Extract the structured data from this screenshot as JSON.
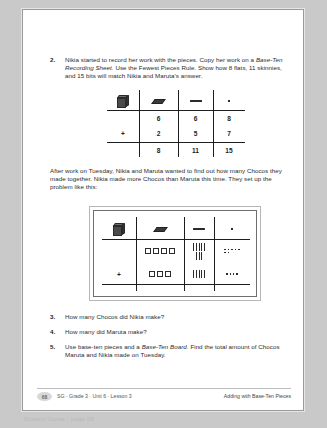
{
  "page": {
    "problem2": {
      "number": "2.",
      "text_part1": "Nikia started to record her work with the pieces. Copy her work on a ",
      "text_italic1": "Base-Ten Recording Sheet.",
      "text_part2": " Use the Fewest Pieces Rule. Show how 8 flats, 11 skinnies, and 15 bits will match Nikia and Maruta's answer."
    },
    "recording_table": {
      "headers": [
        "pack-icon",
        "flat-icon",
        "skinny-icon",
        "bit-icon"
      ],
      "rows": [
        {
          "op": "",
          "flats": "6",
          "skinnies": "6",
          "bits": "8"
        },
        {
          "op": "+",
          "flats": "2",
          "skinnies": "5",
          "bits": "7"
        },
        {
          "op": "",
          "flats": "8",
          "skinnies": "11",
          "bits": "15"
        }
      ]
    },
    "middle_paragraph": "After work on Tuesday, Nikia and Maruta wanted to find out how many Chocos they made together. Nikia made more Chocos than Maruta this time. They set up the problem like this:",
    "pieces_table": {
      "headers": [
        "pack-icon",
        "flat-icon",
        "skinny-icon",
        "bit-icon"
      ],
      "rows": [
        {
          "op": "",
          "flats": 4,
          "skinny_groups": [
            5,
            3
          ],
          "bit_rows": [
            5,
            2
          ]
        },
        {
          "op": "+",
          "flats": 3,
          "skinny_groups": [
            5
          ],
          "bit_rows": [
            4
          ]
        }
      ]
    },
    "questions": [
      {
        "number": "3.",
        "text": "How many Chocos did Nikia make?"
      },
      {
        "number": "4.",
        "text": "How many did Maruta make?"
      },
      {
        "number": "5.",
        "text_part1": "Use base-ten pieces and a ",
        "text_italic1": "Base-Ten Board.",
        "text_part2": " Find the total amount of Chocos Maruta and Nikia made on Tuesday."
      }
    ],
    "footer": {
      "page_number": "68",
      "left": "SG · Grade 3 · Unit 6 · Lesson 3",
      "right": "Adding with Base-Ten Pieces"
    },
    "caption": "Student Guide - page 68"
  }
}
